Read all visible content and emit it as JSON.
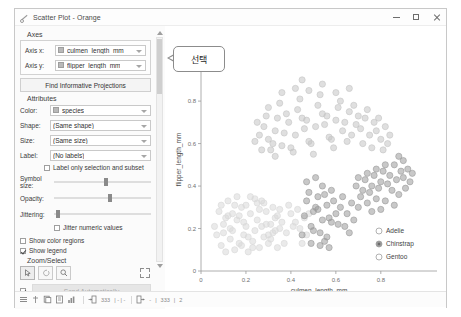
{
  "window": {
    "title": "Scatter Plot - Orange",
    "title_icon": "scatter-plot-icon",
    "controls": {
      "minimize": "minimize-icon",
      "maximize": "maximize-icon",
      "close": "close-icon"
    }
  },
  "panel": {
    "axes": {
      "group_label": "Axes",
      "rows": [
        {
          "label": "Axis x:",
          "value": "culmen_length_mm",
          "value_icon": "numeric-variable-icon"
        },
        {
          "label": "Axis y:",
          "value": "flipper_length_mm",
          "value_icon": "numeric-variable-icon"
        }
      ],
      "find_button": "Find Informative Projections"
    },
    "attributes": {
      "group_label": "Attributes",
      "rows": [
        {
          "label": "Color:",
          "value": "species",
          "value_icon": "categorical-variable-icon"
        },
        {
          "label": "Shape:",
          "value": "(Same shape)",
          "value_icon": ""
        },
        {
          "label": "Size:",
          "value": "(Same size)",
          "value_icon": ""
        },
        {
          "label": "Label:",
          "value": "(No labels)",
          "value_icon": ""
        }
      ],
      "label_only_checkbox": {
        "label": "Label only selection and subset",
        "checked": false
      }
    },
    "sliders": [
      {
        "label": "Symbol size:",
        "value": 52
      },
      {
        "label": "Opacity:",
        "value": 56
      },
      {
        "label": "Jittering:",
        "value": 2
      }
    ],
    "jitter_checkbox": {
      "label": "Jitter numeric values",
      "checked": false
    },
    "show_color_regions": {
      "label": "Show color regions",
      "checked": false
    },
    "show_legend": {
      "label": "Show legend",
      "checked": true
    },
    "zoom_select": {
      "group_label": "Zoom/Select",
      "tools": [
        {
          "name": "select-arrow-icon",
          "active": true
        },
        {
          "name": "pan-icon",
          "active": false
        },
        {
          "name": "zoom-magnifier-icon",
          "active": false
        }
      ],
      "reset_label": "reset-zoom-icon"
    },
    "send": {
      "auto_checkbox_checked": true,
      "button_label": "Send Automatically"
    }
  },
  "callout": {
    "text": "선택"
  },
  "chart_data": {
    "type": "scatter",
    "title": "",
    "xlabel": "culmen_length_mm",
    "ylabel": "flipper_length_mm",
    "xlim": [
      0,
      1.05
    ],
    "ylim": [
      0,
      1.05
    ],
    "xticks": [
      "0",
      "0.2",
      "0.4",
      "0.6",
      "0.8"
    ],
    "yticks": [
      "0",
      "0.2",
      "0.4",
      "0.6",
      "0.8",
      "1"
    ],
    "grid": false,
    "legend_position": "bottom-right",
    "legend_title": "",
    "series": [
      {
        "name": "Adelie",
        "color": "#d9d9d9",
        "selected": false
      },
      {
        "name": "Chinstrap",
        "color": "#9a9a9a",
        "selected": true
      },
      {
        "name": "Gentoo",
        "color": "#c4c4c4",
        "selected": false
      }
    ],
    "points": {
      "Adelie": [
        [
          0.07,
          0.17
        ],
        [
          0.09,
          0.12
        ],
        [
          0.1,
          0.22
        ],
        [
          0.11,
          0.09
        ],
        [
          0.12,
          0.26
        ],
        [
          0.13,
          0.15
        ],
        [
          0.14,
          0.19
        ],
        [
          0.15,
          0.1
        ],
        [
          0.16,
          0.24
        ],
        [
          0.17,
          0.13
        ],
        [
          0.18,
          0.3
        ],
        [
          0.19,
          0.17
        ],
        [
          0.2,
          0.21
        ],
        [
          0.21,
          0.09
        ],
        [
          0.22,
          0.27
        ],
        [
          0.23,
          0.14
        ],
        [
          0.24,
          0.19
        ],
        [
          0.25,
          0.24
        ],
        [
          0.26,
          0.11
        ],
        [
          0.27,
          0.21
        ],
        [
          0.28,
          0.16
        ],
        [
          0.29,
          0.28
        ],
        [
          0.3,
          0.13
        ],
        [
          0.31,
          0.22
        ],
        [
          0.32,
          0.18
        ],
        [
          0.33,
          0.25
        ],
        [
          0.34,
          0.11
        ],
        [
          0.35,
          0.2
        ],
        [
          0.08,
          0.28
        ],
        [
          0.12,
          0.33
        ],
        [
          0.16,
          0.35
        ],
        [
          0.2,
          0.31
        ],
        [
          0.24,
          0.34
        ],
        [
          0.28,
          0.32
        ],
        [
          0.32,
          0.3
        ],
        [
          0.1,
          0.18
        ],
        [
          0.14,
          0.27
        ],
        [
          0.18,
          0.12
        ],
        [
          0.22,
          0.35
        ],
        [
          0.26,
          0.29
        ],
        [
          0.3,
          0.17
        ],
        [
          0.34,
          0.26
        ],
        [
          0.06,
          0.21
        ],
        [
          0.11,
          0.25
        ],
        [
          0.15,
          0.31
        ],
        [
          0.19,
          0.23
        ],
        [
          0.23,
          0.11
        ],
        [
          0.27,
          0.33
        ],
        [
          0.31,
          0.15
        ],
        [
          0.36,
          0.23
        ],
        [
          0.38,
          0.18
        ],
        [
          0.4,
          0.27
        ],
        [
          0.37,
          0.13
        ],
        [
          0.41,
          0.21
        ],
        [
          0.39,
          0.31
        ],
        [
          0.35,
          0.29
        ],
        [
          0.09,
          0.31
        ],
        [
          0.13,
          0.2
        ],
        [
          0.17,
          0.26
        ],
        [
          0.21,
          0.16
        ],
        [
          0.25,
          0.32
        ],
        [
          0.29,
          0.22
        ],
        [
          0.33,
          0.19
        ],
        [
          0.44,
          0.2
        ],
        [
          0.46,
          0.25
        ],
        [
          0.43,
          0.29
        ],
        [
          0.47,
          0.17
        ],
        [
          0.42,
          0.23
        ],
        [
          0.45,
          0.13
        ],
        [
          0.48,
          0.27
        ]
      ],
      "Chinstrap": [
        [
          0.47,
          0.33
        ],
        [
          0.5,
          0.28
        ],
        [
          0.52,
          0.35
        ],
        [
          0.54,
          0.24
        ],
        [
          0.56,
          0.31
        ],
        [
          0.58,
          0.38
        ],
        [
          0.6,
          0.27
        ],
        [
          0.49,
          0.21
        ],
        [
          0.51,
          0.3
        ],
        [
          0.53,
          0.18
        ],
        [
          0.55,
          0.36
        ],
        [
          0.57,
          0.25
        ],
        [
          0.59,
          0.33
        ],
        [
          0.61,
          0.22
        ],
        [
          0.46,
          0.26
        ],
        [
          0.48,
          0.37
        ],
        [
          0.5,
          0.19
        ],
        [
          0.52,
          0.29
        ],
        [
          0.54,
          0.4
        ],
        [
          0.56,
          0.16
        ],
        [
          0.58,
          0.23
        ],
        [
          0.62,
          0.3
        ],
        [
          0.64,
          0.21
        ],
        [
          0.63,
          0.35
        ],
        [
          0.65,
          0.27
        ],
        [
          0.66,
          0.18
        ],
        [
          0.67,
          0.32
        ],
        [
          0.68,
          0.24
        ],
        [
          0.45,
          0.17
        ],
        [
          0.47,
          0.42
        ],
        [
          0.49,
          0.13
        ],
        [
          0.51,
          0.44
        ],
        [
          0.53,
          0.12
        ],
        [
          0.55,
          0.14
        ],
        [
          0.57,
          0.11
        ],
        [
          0.7,
          0.44
        ],
        [
          0.72,
          0.38
        ],
        [
          0.74,
          0.46
        ],
        [
          0.76,
          0.4
        ],
        [
          0.78,
          0.48
        ],
        [
          0.8,
          0.42
        ],
        [
          0.82,
          0.5
        ],
        [
          0.71,
          0.35
        ],
        [
          0.73,
          0.43
        ],
        [
          0.75,
          0.37
        ],
        [
          0.77,
          0.45
        ],
        [
          0.79,
          0.39
        ],
        [
          0.81,
          0.47
        ],
        [
          0.83,
          0.41
        ],
        [
          0.69,
          0.4
        ],
        [
          0.84,
          0.45
        ],
        [
          0.85,
          0.38
        ],
        [
          0.86,
          0.5
        ],
        [
          0.87,
          0.43
        ],
        [
          0.88,
          0.36
        ],
        [
          0.89,
          0.47
        ],
        [
          0.7,
          0.3
        ],
        [
          0.74,
          0.32
        ],
        [
          0.78,
          0.34
        ],
        [
          0.82,
          0.33
        ],
        [
          0.86,
          0.31
        ],
        [
          0.76,
          0.28
        ],
        [
          0.8,
          0.29
        ],
        [
          0.9,
          0.44
        ],
        [
          0.91,
          0.39
        ],
        [
          0.92,
          0.48
        ],
        [
          0.93,
          0.42
        ],
        [
          0.9,
          0.52
        ],
        [
          0.94,
          0.46
        ],
        [
          0.88,
          0.54
        ]
      ],
      "Gentoo": [
        [
          0.3,
          0.62
        ],
        [
          0.33,
          0.66
        ],
        [
          0.36,
          0.59
        ],
        [
          0.39,
          0.7
        ],
        [
          0.42,
          0.64
        ],
        [
          0.45,
          0.72
        ],
        [
          0.48,
          0.61
        ],
        [
          0.51,
          0.68
        ],
        [
          0.54,
          0.74
        ],
        [
          0.57,
          0.63
        ],
        [
          0.6,
          0.71
        ],
        [
          0.63,
          0.66
        ],
        [
          0.66,
          0.75
        ],
        [
          0.69,
          0.69
        ],
        [
          0.31,
          0.57
        ],
        [
          0.34,
          0.72
        ],
        [
          0.37,
          0.65
        ],
        [
          0.4,
          0.58
        ],
        [
          0.43,
          0.76
        ],
        [
          0.46,
          0.67
        ],
        [
          0.49,
          0.6
        ],
        [
          0.52,
          0.78
        ],
        [
          0.55,
          0.69
        ],
        [
          0.58,
          0.62
        ],
        [
          0.61,
          0.77
        ],
        [
          0.64,
          0.7
        ],
        [
          0.67,
          0.64
        ],
        [
          0.7,
          0.73
        ],
        [
          0.28,
          0.68
        ],
        [
          0.32,
          0.6
        ],
        [
          0.35,
          0.79
        ],
        [
          0.38,
          0.74
        ],
        [
          0.41,
          0.56
        ],
        [
          0.44,
          0.81
        ],
        [
          0.47,
          0.71
        ],
        [
          0.5,
          0.55
        ],
        [
          0.53,
          0.83
        ],
        [
          0.56,
          0.73
        ],
        [
          0.59,
          0.58
        ],
        [
          0.62,
          0.8
        ],
        [
          0.65,
          0.61
        ],
        [
          0.68,
          0.78
        ],
        [
          0.71,
          0.67
        ],
        [
          0.73,
          0.72
        ],
        [
          0.75,
          0.64
        ],
        [
          0.77,
          0.7
        ],
        [
          0.72,
          0.6
        ],
        [
          0.74,
          0.76
        ],
        [
          0.76,
          0.58
        ],
        [
          0.26,
          0.64
        ],
        [
          0.29,
          0.73
        ],
        [
          0.27,
          0.57
        ],
        [
          0.25,
          0.7
        ],
        [
          0.24,
          0.61
        ],
        [
          0.3,
          0.77
        ],
        [
          0.33,
          0.54
        ],
        [
          0.78,
          0.66
        ],
        [
          0.8,
          0.62
        ],
        [
          0.79,
          0.72
        ],
        [
          0.81,
          0.57
        ],
        [
          0.82,
          0.68
        ],
        [
          0.83,
          0.6
        ],
        [
          0.84,
          0.64
        ],
        [
          0.36,
          0.84
        ],
        [
          0.42,
          0.86
        ],
        [
          0.48,
          0.85
        ],
        [
          0.54,
          0.88
        ],
        [
          0.6,
          0.84
        ],
        [
          0.66,
          0.86
        ],
        [
          0.45,
          0.9
        ]
      ]
    }
  },
  "statusbar": {
    "icons": [
      "menu-icon",
      "branch-icon",
      "copy-icon",
      "report-icon",
      "chart-icon"
    ],
    "input_icon": "input-arrow-icon",
    "input_count": "333",
    "input_detail": "| - | -",
    "output_icon": "output-arrow-icon",
    "output_detail": "-",
    "output_count": "333",
    "output_extra": "2"
  }
}
